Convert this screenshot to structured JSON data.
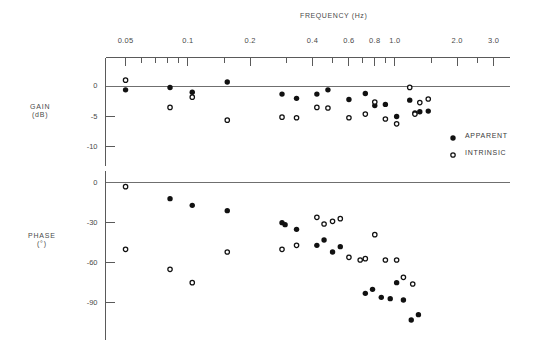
{
  "chart_data": {
    "type": "scatter",
    "title": "FREQUENCY (Hz)",
    "xlabel": "FREQUENCY (Hz)",
    "xscale": "log",
    "xlim": [
      0.04,
      3.6
    ],
    "grid": false,
    "legend_position": "right-middle",
    "x_tick_labels": [
      "0.05",
      "0.1",
      "0.2",
      "0.4",
      "0.6",
      "0.8",
      "1.0",
      "2.0",
      "3.0"
    ],
    "x_tick_values": [
      0.05,
      0.1,
      0.2,
      0.4,
      0.6,
      0.8,
      1.0,
      2.0,
      3.0
    ],
    "x_minor_ticks": [
      0.06,
      0.07,
      0.08,
      0.09,
      0.15,
      0.3,
      0.5,
      0.7,
      0.9,
      1.5,
      2.5
    ],
    "legend": [
      {
        "label": "APPARENT",
        "marker": "filled-circle"
      },
      {
        "label": "INTRINSIC",
        "marker": "open-circle"
      }
    ],
    "panels": [
      {
        "name": "gain",
        "ylabel": "GAIN",
        "yunit": "(dB)",
        "ylim": [
          -13,
          4
        ],
        "y_tick_labels": [
          "0",
          "-5",
          "-10"
        ],
        "y_tick_values": [
          0,
          -5,
          -10
        ],
        "zero_line": 0,
        "series": [
          {
            "name": "APPARENT",
            "marker": "filled-circle",
            "points": [
              [
                0.05,
                -0.6
              ],
              [
                0.082,
                -0.2
              ],
              [
                0.105,
                -1.0
              ],
              [
                0.155,
                0.7
              ],
              [
                0.285,
                -1.3
              ],
              [
                0.335,
                -2.0
              ],
              [
                0.42,
                -1.3
              ],
              [
                0.475,
                -0.6
              ],
              [
                0.6,
                -2.2
              ],
              [
                0.72,
                -1.2
              ],
              [
                0.8,
                -3.2
              ],
              [
                0.9,
                -3.0
              ],
              [
                1.02,
                -5.0
              ],
              [
                1.18,
                -2.3
              ],
              [
                1.25,
                -4.4
              ],
              [
                1.32,
                -4.2
              ],
              [
                1.45,
                -4.1
              ]
            ]
          },
          {
            "name": "INTRINSIC",
            "marker": "open-circle",
            "points": [
              [
                0.05,
                1.0
              ],
              [
                0.082,
                -3.5
              ],
              [
                0.105,
                -1.8
              ],
              [
                0.155,
                -5.6
              ],
              [
                0.285,
                -5.1
              ],
              [
                0.335,
                -5.2
              ],
              [
                0.42,
                -3.5
              ],
              [
                0.475,
                -3.6
              ],
              [
                0.6,
                -5.2
              ],
              [
                0.72,
                -4.6
              ],
              [
                0.8,
                -2.6
              ],
              [
                0.9,
                -5.4
              ],
              [
                1.02,
                -6.2
              ],
              [
                1.18,
                -0.2
              ],
              [
                1.25,
                -4.6
              ],
              [
                1.32,
                -2.7
              ],
              [
                1.45,
                -2.1
              ]
            ]
          }
        ]
      },
      {
        "name": "phase",
        "ylabel": "PHASE",
        "yunit": "(°)",
        "ylim": [
          -115,
          8
        ],
        "y_tick_labels": [
          "0",
          "-30",
          "-60",
          "-90"
        ],
        "y_tick_values": [
          0,
          -30,
          -60,
          -90
        ],
        "zero_line": 0,
        "series": [
          {
            "name": "APPARENT",
            "marker": "filled-circle",
            "points": [
              [
                0.082,
                -12.0
              ],
              [
                0.105,
                -17.0
              ],
              [
                0.155,
                -21.0
              ],
              [
                0.285,
                -30.0
              ],
              [
                0.295,
                -31.5
              ],
              [
                0.335,
                -35.0
              ],
              [
                0.42,
                -47.0
              ],
              [
                0.455,
                -43.0
              ],
              [
                0.5,
                -52.0
              ],
              [
                0.545,
                -48.0
              ],
              [
                0.72,
                -83.0
              ],
              [
                0.78,
                -80.0
              ],
              [
                0.86,
                -86.0
              ],
              [
                0.95,
                -87.0
              ],
              [
                1.02,
                -75.0
              ],
              [
                1.1,
                -88.0
              ],
              [
                1.2,
                -103.0
              ],
              [
                1.3,
                -99.0
              ]
            ]
          },
          {
            "name": "INTRINSIC",
            "marker": "open-circle",
            "points": [
              [
                0.05,
                -3.0
              ],
              [
                0.05,
                -50.0
              ],
              [
                0.082,
                -65.0
              ],
              [
                0.105,
                -75.0
              ],
              [
                0.155,
                -52.0
              ],
              [
                0.285,
                -50.0
              ],
              [
                0.335,
                -47.0
              ],
              [
                0.42,
                -26.0
              ],
              [
                0.455,
                -31.0
              ],
              [
                0.5,
                -29.0
              ],
              [
                0.545,
                -27.0
              ],
              [
                0.6,
                -56.0
              ],
              [
                0.68,
                -58.0
              ],
              [
                0.72,
                -57.0
              ],
              [
                0.8,
                -39.0
              ],
              [
                0.9,
                -58.0
              ],
              [
                1.02,
                -58.0
              ],
              [
                1.1,
                -71.0
              ],
              [
                1.22,
                -76.0
              ]
            ]
          }
        ]
      }
    ]
  }
}
